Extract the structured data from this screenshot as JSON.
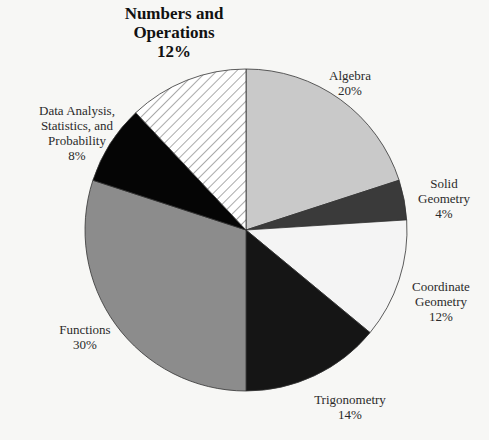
{
  "chart_data": {
    "type": "pie",
    "title": "",
    "start_angle_deg": 0,
    "direction": "clockwise",
    "categories": [
      "Algebra",
      "Solid Geometry",
      "Coordinate Geometry",
      "Trigonometry",
      "Functions",
      "Data Analysis, Statistics, and Probability",
      "Numbers and Operations"
    ],
    "values": [
      20,
      4,
      12,
      14,
      30,
      8,
      12
    ],
    "unit": "%",
    "slices": [
      {
        "label": "Algebra",
        "value": 20,
        "fill": "#c9c9c9",
        "pattern": "solid"
      },
      {
        "label": "Solid Geometry",
        "value": 4,
        "fill": "#3a3a3a",
        "pattern": "solid"
      },
      {
        "label": "Coordinate Geometry",
        "value": 12,
        "fill": "#f4f4f4",
        "pattern": "solid"
      },
      {
        "label": "Trigonometry",
        "value": 14,
        "fill": "#151515",
        "pattern": "solid"
      },
      {
        "label": "Functions",
        "value": 30,
        "fill": "#8c8c8c",
        "pattern": "solid"
      },
      {
        "label": "Data Analysis, Statistics, and Probability",
        "value": 8,
        "fill": "#050505",
        "pattern": "solid"
      },
      {
        "label": "Numbers and Operations",
        "value": 12,
        "fill": "#ffffff",
        "pattern": "diagonal-hatch",
        "emphasized": true
      }
    ]
  },
  "labels": {
    "numbers": {
      "line1": "Numbers and",
      "line2": "Operations",
      "pct": "12%"
    },
    "algebra": {
      "line1": "Algebra",
      "pct": "20%"
    },
    "solid": {
      "line1": "Solid",
      "line2": "Geometry",
      "pct": "4%"
    },
    "coord": {
      "line1": "Coordinate",
      "line2": "Geometry",
      "pct": "12%"
    },
    "trig": {
      "line1": "Trigonometry",
      "pct": "14%"
    },
    "functions": {
      "line1": "Functions",
      "pct": "30%"
    },
    "data": {
      "line1": "Data Analysis,",
      "line2": "Statistics, and",
      "line3": "Probability",
      "pct": "8%"
    }
  }
}
